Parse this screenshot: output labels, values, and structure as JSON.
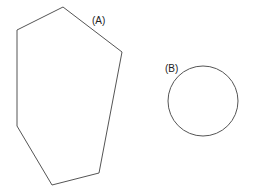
{
  "diagram": {
    "background": "#ffffff",
    "stroke_color": "#555555",
    "shapes": [
      {
        "id": "A",
        "type": "heptagon",
        "label": "(A)",
        "label_pos": [
          92,
          16
        ],
        "points": [
          [
            63,
            7
          ],
          [
            122,
            52
          ],
          [
            99,
            173
          ],
          [
            52,
            185
          ],
          [
            17,
            126
          ],
          [
            17,
            30
          ]
        ]
      },
      {
        "id": "B",
        "type": "circle",
        "label": "(B)",
        "label_pos": [
          165,
          64
        ],
        "center": [
          203,
          101
        ],
        "radius": 35
      }
    ]
  }
}
